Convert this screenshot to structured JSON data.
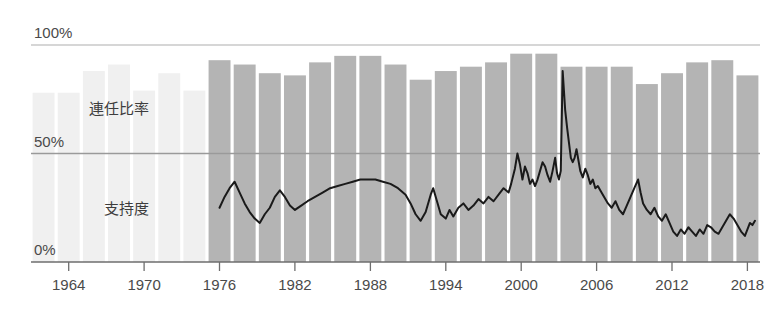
{
  "chart_data": {
    "type": "bar",
    "title": "",
    "subtitle": "",
    "xlabel": "",
    "ylabel": "",
    "xlim": [
      1961,
      2019
    ],
    "ylim": [
      0,
      100
    ],
    "grid": true,
    "legend_position": "inline-annotation",
    "y_ticks": [
      {
        "value": 0,
        "label": "0%"
      },
      {
        "value": 50,
        "label": "50%"
      },
      {
        "value": 100,
        "label": "100%"
      }
    ],
    "x_ticks": [
      {
        "value": 1964,
        "label": "1964"
      },
      {
        "value": 1970,
        "label": "1970"
      },
      {
        "value": 1976,
        "label": "1976"
      },
      {
        "value": 1982,
        "label": "1982"
      },
      {
        "value": 1988,
        "label": "1988"
      },
      {
        "value": 1994,
        "label": "1994"
      },
      {
        "value": 2000,
        "label": "2000"
      },
      {
        "value": 2006,
        "label": "2006"
      },
      {
        "value": 2012,
        "label": "2012"
      },
      {
        "value": 2018,
        "label": "2018"
      }
    ],
    "annotations": [
      {
        "text": "連任比率",
        "x": 1968.0,
        "y": 68
      },
      {
        "text": "支持度",
        "x": 1968.6,
        "y": 22
      }
    ],
    "colors": {
      "bar_active": "#b4b4b4",
      "bar_faded": "#f0f0f0",
      "line": "#1a1a1a",
      "axis": "#6e6e6e",
      "gridline": "#9a9a9a",
      "tick_text": "#4a4a4a"
    },
    "series": [
      {
        "name": "連任比率",
        "type": "bar",
        "unit": "%",
        "faded_before": 1976,
        "bars": [
          {
            "x": 1962,
            "value": 78,
            "faded": true
          },
          {
            "x": 1964,
            "value": 78,
            "faded": true
          },
          {
            "x": 1966,
            "value": 88,
            "faded": true
          },
          {
            "x": 1968,
            "value": 91,
            "faded": true
          },
          {
            "x": 1970,
            "value": 79,
            "faded": true
          },
          {
            "x": 1972,
            "value": 87,
            "faded": true
          },
          {
            "x": 1974,
            "value": 79,
            "faded": true
          },
          {
            "x": 1976,
            "value": 93,
            "faded": false
          },
          {
            "x": 1978,
            "value": 91,
            "faded": false
          },
          {
            "x": 1980,
            "value": 87,
            "faded": false
          },
          {
            "x": 1982,
            "value": 86,
            "faded": false
          },
          {
            "x": 1984,
            "value": 92,
            "faded": false
          },
          {
            "x": 1986,
            "value": 95,
            "faded": false
          },
          {
            "x": 1988,
            "value": 95,
            "faded": false
          },
          {
            "x": 1990,
            "value": 91,
            "faded": false
          },
          {
            "x": 1992,
            "value": 84,
            "faded": false
          },
          {
            "x": 1994,
            "value": 88,
            "faded": false
          },
          {
            "x": 1996,
            "value": 90,
            "faded": false
          },
          {
            "x": 1998,
            "value": 92,
            "faded": false
          },
          {
            "x": 2000,
            "value": 96,
            "faded": false
          },
          {
            "x": 2002,
            "value": 96,
            "faded": false
          },
          {
            "x": 2004,
            "value": 90,
            "faded": false
          },
          {
            "x": 2006,
            "value": 90,
            "faded": false
          },
          {
            "x": 2008,
            "value": 90,
            "faded": false
          },
          {
            "x": 2010,
            "value": 82,
            "faded": false
          },
          {
            "x": 2012,
            "value": 87,
            "faded": false
          },
          {
            "x": 2014,
            "value": 92,
            "faded": false
          },
          {
            "x": 2016,
            "value": 93,
            "faded": false
          },
          {
            "x": 2018,
            "value": 86,
            "faded": false
          }
        ]
      },
      {
        "name": "支持度",
        "type": "line",
        "unit": "%",
        "points": [
          [
            1976.0,
            25
          ],
          [
            1976.4,
            30
          ],
          [
            1976.8,
            34
          ],
          [
            1977.2,
            37
          ],
          [
            1977.6,
            32
          ],
          [
            1978.0,
            27
          ],
          [
            1978.4,
            23
          ],
          [
            1978.8,
            20
          ],
          [
            1979.2,
            18
          ],
          [
            1979.6,
            22
          ],
          [
            1980.0,
            25
          ],
          [
            1980.4,
            30
          ],
          [
            1980.8,
            33
          ],
          [
            1981.2,
            30
          ],
          [
            1981.6,
            26
          ],
          [
            1982.0,
            24
          ],
          [
            1982.5,
            26
          ],
          [
            1983.0,
            28
          ],
          [
            1983.6,
            30
          ],
          [
            1984.2,
            32
          ],
          [
            1984.8,
            34
          ],
          [
            1985.4,
            35
          ],
          [
            1986.0,
            36
          ],
          [
            1986.6,
            37
          ],
          [
            1987.2,
            38
          ],
          [
            1987.8,
            38
          ],
          [
            1988.4,
            38
          ],
          [
            1989.0,
            37
          ],
          [
            1989.6,
            36
          ],
          [
            1990.2,
            34
          ],
          [
            1990.8,
            31
          ],
          [
            1991.2,
            27
          ],
          [
            1991.6,
            22
          ],
          [
            1992.0,
            19
          ],
          [
            1992.4,
            23
          ],
          [
            1992.8,
            31
          ],
          [
            1993.0,
            34
          ],
          [
            1993.3,
            28
          ],
          [
            1993.6,
            22
          ],
          [
            1994.0,
            20
          ],
          [
            1994.3,
            24
          ],
          [
            1994.6,
            21
          ],
          [
            1995.0,
            25
          ],
          [
            1995.4,
            27
          ],
          [
            1995.8,
            24
          ],
          [
            1996.2,
            26
          ],
          [
            1996.6,
            29
          ],
          [
            1997.0,
            27
          ],
          [
            1997.4,
            30
          ],
          [
            1997.8,
            28
          ],
          [
            1998.2,
            31
          ],
          [
            1998.6,
            34
          ],
          [
            1999.0,
            32
          ],
          [
            1999.2,
            36
          ],
          [
            1999.5,
            43
          ],
          [
            1999.7,
            50
          ],
          [
            1999.9,
            45
          ],
          [
            2000.1,
            38
          ],
          [
            2000.3,
            44
          ],
          [
            2000.5,
            41
          ],
          [
            2000.7,
            36
          ],
          [
            2000.9,
            38
          ],
          [
            2001.1,
            35
          ],
          [
            2001.3,
            38
          ],
          [
            2001.5,
            42
          ],
          [
            2001.7,
            46
          ],
          [
            2001.9,
            44
          ],
          [
            2002.1,
            40
          ],
          [
            2002.3,
            37
          ],
          [
            2002.5,
            42
          ],
          [
            2002.7,
            48
          ],
          [
            2002.85,
            41
          ],
          [
            2003.0,
            38
          ],
          [
            2003.15,
            42
          ],
          [
            2003.3,
            88
          ],
          [
            2003.5,
            70
          ],
          [
            2003.65,
            62
          ],
          [
            2003.8,
            55
          ],
          [
            2003.95,
            48
          ],
          [
            2004.1,
            46
          ],
          [
            2004.25,
            48
          ],
          [
            2004.4,
            52
          ],
          [
            2004.55,
            47
          ],
          [
            2004.7,
            42
          ],
          [
            2004.9,
            39
          ],
          [
            2005.1,
            43
          ],
          [
            2005.3,
            40
          ],
          [
            2005.5,
            36
          ],
          [
            2005.7,
            38
          ],
          [
            2005.9,
            34
          ],
          [
            2006.1,
            35
          ],
          [
            2006.3,
            33
          ],
          [
            2006.6,
            30
          ],
          [
            2006.9,
            27
          ],
          [
            2007.2,
            25
          ],
          [
            2007.5,
            28
          ],
          [
            2007.8,
            24
          ],
          [
            2008.1,
            22
          ],
          [
            2008.4,
            26
          ],
          [
            2008.7,
            30
          ],
          [
            2009.0,
            34
          ],
          [
            2009.3,
            38
          ],
          [
            2009.5,
            32
          ],
          [
            2009.7,
            27
          ],
          [
            2010.0,
            24
          ],
          [
            2010.3,
            22
          ],
          [
            2010.6,
            25
          ],
          [
            2010.9,
            21
          ],
          [
            2011.2,
            19
          ],
          [
            2011.5,
            22
          ],
          [
            2011.8,
            18
          ],
          [
            2012.1,
            14
          ],
          [
            2012.4,
            12
          ],
          [
            2012.7,
            15
          ],
          [
            2013.0,
            13
          ],
          [
            2013.3,
            16
          ],
          [
            2013.6,
            14
          ],
          [
            2013.9,
            12
          ],
          [
            2014.2,
            15
          ],
          [
            2014.5,
            13
          ],
          [
            2014.8,
            17
          ],
          [
            2015.1,
            16
          ],
          [
            2015.4,
            14
          ],
          [
            2015.7,
            13
          ],
          [
            2016.0,
            16
          ],
          [
            2016.3,
            19
          ],
          [
            2016.6,
            22
          ],
          [
            2016.9,
            20
          ],
          [
            2017.2,
            17
          ],
          [
            2017.5,
            14
          ],
          [
            2017.8,
            12
          ],
          [
            2018.0,
            15
          ],
          [
            2018.2,
            18
          ],
          [
            2018.4,
            17
          ],
          [
            2018.6,
            19
          ]
        ]
      }
    ]
  }
}
